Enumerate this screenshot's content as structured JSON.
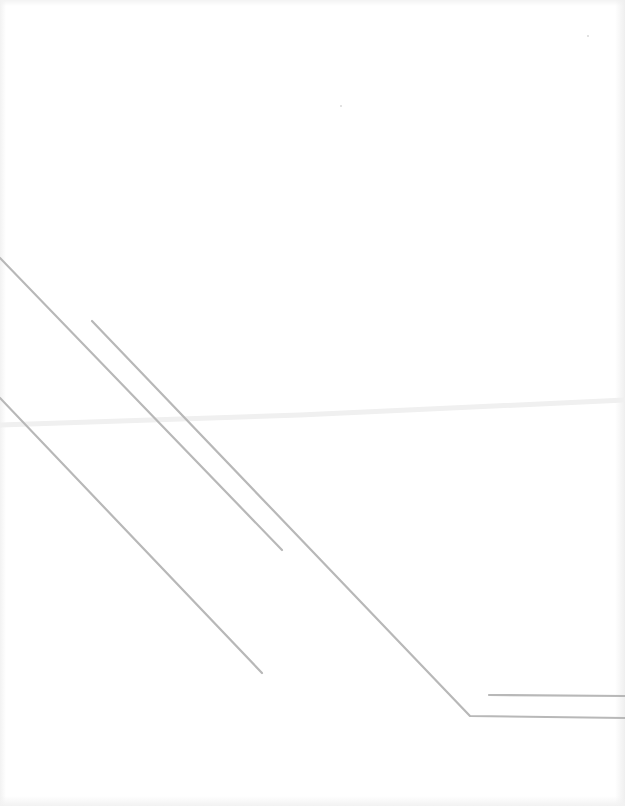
{
  "page": {
    "width": 625,
    "height": 806,
    "background": "#ffffff",
    "line_color": "#b8b8b8",
    "line_width": 2.2,
    "fold_color": "#f1f1f1"
  },
  "lines": [
    {
      "id": "line-a",
      "points": "0,258 282,550"
    },
    {
      "id": "line-b",
      "points": "92,321 470,716 625,718"
    },
    {
      "id": "line-c",
      "points": "0,398 262,673"
    },
    {
      "id": "line-d",
      "points": "489,695 625,696"
    }
  ],
  "specks": [
    {
      "x": 587,
      "y": 35
    },
    {
      "x": 340,
      "y": 105
    }
  ]
}
